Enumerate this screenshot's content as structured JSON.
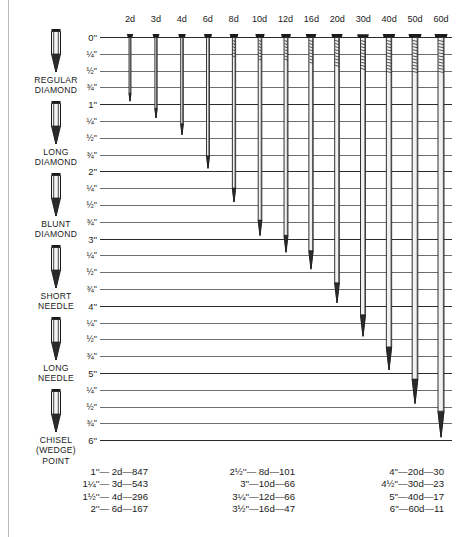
{
  "point_types": [
    {
      "name": "regular-diamond",
      "label_lines": [
        "REGULAR",
        "DIAMOND"
      ],
      "art": "regular-diamond-point"
    },
    {
      "name": "long-diamond",
      "label_lines": [
        "LONG",
        "DIAMOND"
      ],
      "art": "long-diamond-point"
    },
    {
      "name": "blunt-diamond",
      "label_lines": [
        "BLUNT",
        "DIAMOND"
      ],
      "art": "blunt-diamond-point"
    },
    {
      "name": "short-needle",
      "label_lines": [
        "SHORT",
        "NEEDLE"
      ],
      "art": "short-needle-point"
    },
    {
      "name": "long-needle",
      "label_lines": [
        "LONG",
        "NEEDLE"
      ],
      "art": "long-needle-point"
    },
    {
      "name": "chisel-wedge",
      "label_lines": [
        "CHISEL",
        "(WEDGE)",
        "POINT"
      ],
      "art": "chisel-wedge-point"
    }
  ],
  "chart_data": {
    "type": "bar",
    "orientation": "vertical-downward",
    "xlabel": "",
    "ylabel": "",
    "ylim": [
      0,
      6
    ],
    "yunit": "inches",
    "grid": true,
    "legend": false,
    "categories": [
      "2d",
      "3d",
      "4d",
      "6d",
      "8d",
      "10d",
      "12d",
      "16d",
      "20d",
      "30d",
      "40d",
      "50d",
      "60d"
    ],
    "values": [
      1,
      1.25,
      1.5,
      2,
      2.5,
      3,
      3.25,
      3.5,
      4,
      4.5,
      5,
      5.5,
      6
    ],
    "tick_labels": [
      "0''",
      "¼''",
      "½''",
      "¾''",
      "1''",
      "¼''",
      "½''",
      "¾''",
      "2''",
      "¼''",
      "½''",
      "¾''",
      "3''",
      "¼''",
      "½''",
      "¾''",
      "4''",
      "¼''",
      "½''",
      "¾''",
      "5''",
      "¼''",
      "½''",
      "¾''",
      "6''"
    ],
    "tick_values": [
      0,
      0.25,
      0.5,
      0.75,
      1,
      1.25,
      1.5,
      1.75,
      2,
      2.25,
      2.5,
      2.75,
      3,
      3.25,
      3.5,
      3.75,
      4,
      4.25,
      4.5,
      4.75,
      5,
      5.25,
      5.5,
      5.75,
      6
    ],
    "major_ticks": [
      0,
      1,
      2,
      3,
      4,
      5,
      6
    ]
  },
  "size_table": {
    "columns": [
      {
        "name": "column-1",
        "rows": [
          {
            "length": "1''",
            "penny": "2d",
            "count": "847",
            "text": "1''— 2d—847"
          },
          {
            "length": "1¼''",
            "penny": "3d",
            "count": "543",
            "text": "1¼''— 3d—543"
          },
          {
            "length": "1½''",
            "penny": "4d",
            "count": "296",
            "text": "1½''— 4d—296"
          },
          {
            "length": "2''",
            "penny": "6d",
            "count": "167",
            "text": "2''— 6d—167"
          }
        ]
      },
      {
        "name": "column-2",
        "rows": [
          {
            "length": "2½''",
            "penny": "8d",
            "count": "101",
            "text": "2½''— 8d—101"
          },
          {
            "length": "3''",
            "penny": "10d",
            "count": "66",
            "text": "3''—10d—66"
          },
          {
            "length": "3¼''",
            "penny": "12d",
            "count": "66",
            "text": "3¼''—12d—66"
          },
          {
            "length": "3½''",
            "penny": "16d",
            "count": "47",
            "text": "3½''—16d—47"
          }
        ]
      },
      {
        "name": "column-3",
        "rows": [
          {
            "length": "4''",
            "penny": "20d",
            "count": "30",
            "text": "4''—20d—30"
          },
          {
            "length": "4½''",
            "penny": "30d",
            "count": "23",
            "text": "4½''—30d—23"
          },
          {
            "length": "5''",
            "penny": "40d",
            "count": "17",
            "text": "5''—40d—17"
          },
          {
            "length": "6''",
            "penny": "60d",
            "count": "11",
            "text": "6''—60d—11"
          }
        ]
      }
    ]
  },
  "colors": {
    "background": "#ffffff",
    "ink": "#1b1b1b",
    "gridline": "#6e6e6e",
    "gridline_major": "#2b2b2b",
    "page_rule": "#b9b9b9",
    "nail_body": "#f2f2f2",
    "nail_outline": "#1b1b1b"
  }
}
